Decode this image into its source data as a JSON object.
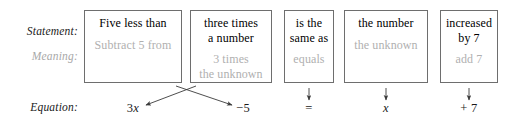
{
  "diagram": {
    "row_labels": {
      "statement": "Statement:",
      "meaning": "Meaning:",
      "equation": "Equation:"
    },
    "colors": {
      "statement_text": "#000000",
      "meaning_text": "#b0b0b0",
      "box_border": "#6e6e6e",
      "arrow": "#3a3a3a",
      "equation_text": "#1a1a1a"
    },
    "boxes": [
      {
        "id": "box-1",
        "statement": "Five less than",
        "meaning": "Subtract 5 from",
        "equation_term": "−5",
        "arrow": "cross-to-right"
      },
      {
        "id": "box-2",
        "statement": "three times\na number",
        "meaning": "3 times\nthe unknown",
        "equation_term": "3x",
        "arrow": "cross-to-left"
      },
      {
        "id": "box-3",
        "statement": "is the\nsame as",
        "meaning": "equals",
        "equation_term": "=",
        "arrow": "down"
      },
      {
        "id": "box-4",
        "statement": "the number",
        "meaning": "the unknown",
        "equation_term": "x",
        "arrow": "down"
      },
      {
        "id": "box-5",
        "statement": "increased\nby 7",
        "meaning": "add 7",
        "equation_term": "+ 7",
        "arrow": "down"
      }
    ],
    "equation_terms": {
      "term_3x_coefficient": "3",
      "term_3x_variable": "x",
      "term_minus_five": "−5",
      "term_equals": "=",
      "term_x": "x",
      "term_plus_seven": "+ 7"
    },
    "resulting_equation": "3x − 5 = x + 7"
  }
}
